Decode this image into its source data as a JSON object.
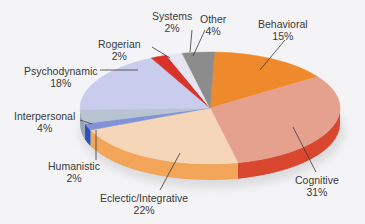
{
  "chart_data": {
    "type": "pie",
    "style": "3d",
    "title": "",
    "slices": [
      {
        "label": "Behavioral",
        "value": 15,
        "display": "15%",
        "color": "#ee8a2c",
        "side": "#c8661a"
      },
      {
        "label": "Cognitive",
        "value": 31,
        "display": "31%",
        "color": "#e6a08e",
        "side": "#d8472e"
      },
      {
        "label": "Eclectic/Integrative",
        "value": 22,
        "display": "22%",
        "color": "#f6d6b8",
        "side": "#f3a55a"
      },
      {
        "label": "Humanistic",
        "value": 2,
        "display": "2%",
        "color": "#7f93d6",
        "side": "#2752b8"
      },
      {
        "label": "Interpersonal",
        "value": 4,
        "display": "4%",
        "color": "#b9c4d3",
        "side": "#9aa6b8"
      },
      {
        "label": "Psychodynamic",
        "value": 18,
        "display": "18%",
        "color": "#c9ccec",
        "side": "#a8abd0"
      },
      {
        "label": "Rogerian",
        "value": 2,
        "display": "2%",
        "color": "#d9322a",
        "side": "#b52620"
      },
      {
        "label": "Systems",
        "value": 2,
        "display": "2%",
        "color": "#e6e6f2",
        "side": "#cfcfe0"
      },
      {
        "label": "Other",
        "value": 4,
        "display": "4%",
        "color": "#8c8c8c",
        "side": "#6e6e6e"
      }
    ],
    "legend": "none",
    "labels_position": "outside with leader lines"
  },
  "labels": {
    "behavioral": {
      "name": "Behavioral",
      "pct": "15%"
    },
    "cognitive": {
      "name": "Cognitive",
      "pct": "31%"
    },
    "eclectic": {
      "name": "Eclectic/Integrative",
      "pct": "22%"
    },
    "humanistic": {
      "name": "Humanistic",
      "pct": "2%"
    },
    "interpersonal": {
      "name": "Interpersonal",
      "pct": "4%"
    },
    "psychodynamic": {
      "name": "Psychodynamic",
      "pct": "18%"
    },
    "rogerian": {
      "name": "Rogerian",
      "pct": "2%"
    },
    "systems": {
      "name": "Systems",
      "pct": "2%"
    },
    "other": {
      "name": "Other",
      "pct": "4%"
    }
  }
}
